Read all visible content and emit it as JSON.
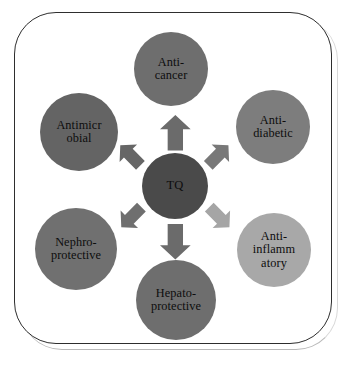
{
  "figure": {
    "type": "radial-hub-and-spoke-diagram",
    "background_color": "#ffffff",
    "frame": {
      "border_color": "#2e2e2e",
      "corner_radius_px": 42,
      "shadow_color": "#b9b9b9"
    }
  },
  "hub": {
    "name": "TQ",
    "label": "TQ",
    "color": "#4a4a4a",
    "text_color": "#0d0d0d",
    "cx": 175,
    "cy": 186,
    "r": 33
  },
  "satellites": [
    {
      "id": "anti-cancer",
      "label": "Anti-\ncancer",
      "color": "#6e6e6e",
      "cx": 171,
      "cy": 69,
      "r": 37,
      "position": "top"
    },
    {
      "id": "anti-diabetic",
      "label": "Anti-\ndiabetic",
      "color": "#7d7d7d",
      "cx": 273,
      "cy": 127,
      "r": 37,
      "position": "top-right"
    },
    {
      "id": "anti-inflammatory",
      "label": "Anti-\ninflamm\natory",
      "color": "#a8a8a8",
      "cx": 274,
      "cy": 250,
      "r": 37,
      "position": "bottom-right"
    },
    {
      "id": "hepato-protective",
      "label": "Hepato-\nprotective",
      "color": "#6e6e6e",
      "cx": 176,
      "cy": 300,
      "r": 40,
      "position": "bottom"
    },
    {
      "id": "nephro-protective",
      "label": "Nephro-\nprotective",
      "color": "#707070",
      "cx": 76,
      "cy": 249,
      "r": 41,
      "position": "bottom-left"
    },
    {
      "id": "antimicrobial",
      "label": "Antimicr\nobial",
      "color": "#646464",
      "cx": 79,
      "cy": 132,
      "r": 39,
      "position": "top-left"
    }
  ],
  "arrows": [
    {
      "id": "arrow-to-anti-cancer",
      "target": "anti-cancer",
      "color": "#6b6b6b",
      "x": 175,
      "y": 133,
      "angle_deg": 0,
      "scale": 1.18
    },
    {
      "id": "arrow-to-anti-diabetic",
      "target": "anti-diabetic",
      "color": "#787878",
      "x": 218,
      "y": 155,
      "angle_deg": 45,
      "scale": 0.95
    },
    {
      "id": "arrow-to-anti-inflammatory",
      "target": "anti-inflammatory",
      "color": "#a5a5a5",
      "x": 219,
      "y": 217,
      "angle_deg": 135,
      "scale": 0.95
    },
    {
      "id": "arrow-to-hepato-protective",
      "target": "hepato-protective",
      "color": "#6b6b6b",
      "x": 175,
      "y": 242,
      "angle_deg": 180,
      "scale": 1.18
    },
    {
      "id": "arrow-to-nephro-protective",
      "target": "nephro-protective",
      "color": "#6f6f6f",
      "x": 131,
      "y": 217,
      "angle_deg": -135,
      "scale": 0.95
    },
    {
      "id": "arrow-to-antimicrobial",
      "target": "antimicrobial",
      "color": "#666666",
      "x": 130,
      "y": 155,
      "angle_deg": -45,
      "scale": 0.95
    }
  ]
}
